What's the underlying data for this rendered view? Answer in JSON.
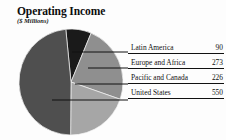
{
  "chart_data": {
    "type": "pie",
    "title": "Operating Income",
    "subtitle": "($ Millions)",
    "unit": "$ Millions",
    "categories": [
      "Latin America",
      "Europe and Africa",
      "Pacific and Canada",
      "United States"
    ],
    "values": [
      90,
      273,
      226,
      550
    ],
    "total": 1139,
    "percentages": [
      7.9,
      24.0,
      19.8,
      48.3
    ],
    "colors": [
      "#1a1a1a",
      "#8f8f8f",
      "#a6a6a6",
      "#4f4f4f"
    ],
    "legend_position": "right",
    "grid": false,
    "xlabel": "",
    "ylabel": "",
    "slices": [
      {
        "label": "Latin America",
        "value": 90,
        "value_text": "90",
        "color": "#1a1a1a",
        "percent": 7.9
      },
      {
        "label": "Europe and Africa",
        "value": 273,
        "value_text": "273",
        "color": "#8f8f8f",
        "percent": 24.0
      },
      {
        "label": "Pacific and Canada",
        "value": 226,
        "value_text": "226",
        "color": "#a6a6a6",
        "percent": 19.8
      },
      {
        "label": "United States",
        "value": 550,
        "value_text": "550",
        "color": "#4f4f4f",
        "percent": 48.3
      }
    ]
  },
  "legend": {
    "rows": [
      {
        "label": "Latin America",
        "value": "90"
      },
      {
        "label": "Europe and Africa",
        "value": "273"
      },
      {
        "label": "Pacific and Canada",
        "value": "226"
      },
      {
        "label": "United States",
        "value": "550"
      }
    ]
  }
}
